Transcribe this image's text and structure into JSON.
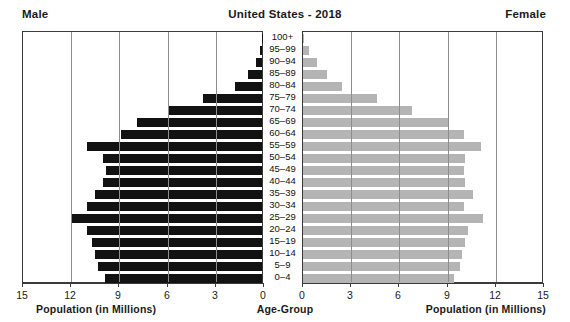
{
  "header": {
    "male_label": "Male",
    "title": "United States - 2018",
    "female_label": "Female"
  },
  "footer": {
    "left_axis_label": "Population (in Millions)",
    "center_label": "Age-Group",
    "right_axis_label": "Population (in Millions)"
  },
  "axis": {
    "left_ticks": [
      "15",
      "12",
      "9",
      "6",
      "3",
      "0"
    ],
    "right_ticks": [
      "0",
      "3",
      "6",
      "9",
      "12",
      "15"
    ]
  },
  "chart_data": {
    "type": "bar",
    "title": "United States - 2018",
    "subtype": "population-pyramid",
    "xlabel": "Population (in Millions)",
    "ylabel": "Age-Group",
    "xlim": [
      0,
      15
    ],
    "grid": true,
    "legend": [
      "Male",
      "Female"
    ],
    "legend_position": "top-left-and-top-right",
    "colors": {
      "male": "#121212",
      "female": "#b4b4b4",
      "frame": "#3a3a3a",
      "gridline": "#8d8d8d",
      "background": "#ffffff"
    },
    "categories": [
      "100+",
      "95–99",
      "90–94",
      "85–89",
      "80–84",
      "75–79",
      "70–74",
      "65–69",
      "60–64",
      "55–59",
      "50–54",
      "45–49",
      "40–44",
      "35–39",
      "30–34",
      "25–29",
      "20–24",
      "15–19",
      "10–14",
      "5–9",
      "0–4"
    ],
    "series": [
      {
        "name": "Male",
        "values": [
          0.02,
          0.15,
          0.4,
          0.9,
          1.7,
          3.7,
          5.8,
          7.8,
          8.8,
          10.9,
          9.9,
          9.7,
          9.9,
          10.4,
          10.9,
          11.9,
          10.9,
          10.6,
          10.4,
          10.2,
          9.8
        ]
      },
      {
        "name": "Female",
        "values": [
          0.06,
          0.4,
          0.9,
          1.5,
          2.4,
          4.6,
          6.8,
          9.0,
          10.0,
          11.1,
          10.1,
          10.0,
          10.1,
          10.6,
          10.0,
          11.2,
          10.3,
          10.1,
          9.9,
          9.8,
          9.4
        ]
      }
    ]
  }
}
